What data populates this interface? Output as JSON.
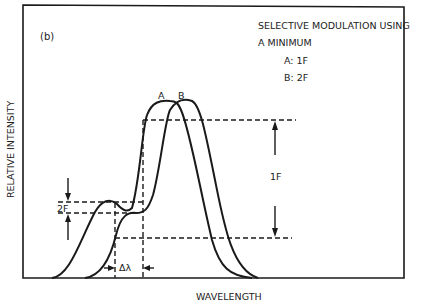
{
  "figure": {
    "panel_label": "(b)",
    "title_line1": "SELECTIVE MODULATION USING",
    "title_line2": "A MINIMUM",
    "legend": [
      {
        "key": "A",
        "text": "A: 1F"
      },
      {
        "key": "B",
        "text": "B: 2F"
      }
    ],
    "x_axis_label": "WAVELENGTH",
    "y_axis_label": "RELATIVE INTENSITY",
    "curve_labels": {
      "a": "A",
      "b": "B"
    },
    "annotations": {
      "one_f": "1F",
      "two_f": "2F",
      "delta_lambda": "Δλ"
    },
    "colors": {
      "ink": "#1a1a1a",
      "background": "#ffffff"
    }
  }
}
